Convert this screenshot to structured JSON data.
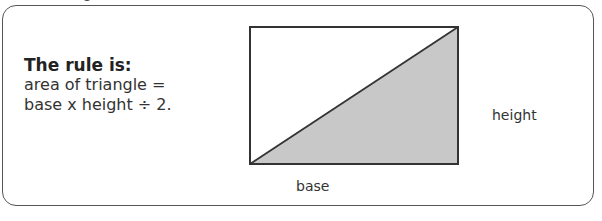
{
  "rule": {
    "title": "The rule is:",
    "line1": "area of triangle =",
    "line2": "base x height ÷ 2."
  },
  "diagram": {
    "shape": "rectangle split by diagonal into two right triangles",
    "shaded_color": "#c8c8c8",
    "unshaded_color": "#ffffff",
    "stroke_color": "#333333",
    "labels": {
      "base": "base",
      "height": "height"
    }
  }
}
